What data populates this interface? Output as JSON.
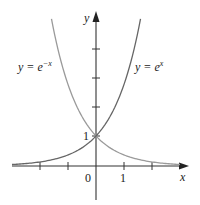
{
  "chart_data": {
    "type": "line",
    "title": "",
    "xlabel": "x",
    "ylabel": "y",
    "x_tick_labels": [
      "0",
      "1"
    ],
    "y_tick_labels": [
      "1"
    ],
    "xlim": [
      -3,
      3.3
    ],
    "ylim": [
      0,
      5.1
    ],
    "grid": false,
    "series": [
      {
        "name": "y = e^{-x}",
        "label_text": "y = e",
        "label_sup": "−x",
        "function": "exp(-x)",
        "domain": [
          -1.59,
          3
        ],
        "color": "#9a9a9a",
        "points": [
          [
            -1.59,
            4.9
          ],
          [
            -1,
            2.72
          ],
          [
            0,
            1
          ],
          [
            1,
            0.37
          ],
          [
            2,
            0.14
          ],
          [
            3,
            0.05
          ]
        ]
      },
      {
        "name": "y = e^{x}",
        "label_text": "y = e",
        "label_sup": "x",
        "function": "exp(x)",
        "domain": [
          -3,
          1.59
        ],
        "color": "#666666",
        "points": [
          [
            -3,
            0.05
          ],
          [
            -2,
            0.14
          ],
          [
            -1,
            0.37
          ],
          [
            0,
            1
          ],
          [
            1,
            2.72
          ],
          [
            1.59,
            4.9
          ]
        ]
      }
    ],
    "annotations": [
      "Curves intersect at (0, 1)"
    ]
  },
  "axes": {
    "x_label": "x",
    "y_label": "y",
    "origin_label": "0",
    "x_one_label": "1",
    "y_one_label": "1"
  },
  "labels": {
    "neg": {
      "base": "y = e",
      "sup": "−x"
    },
    "pos": {
      "base": "y = e",
      "sup": "x"
    }
  }
}
